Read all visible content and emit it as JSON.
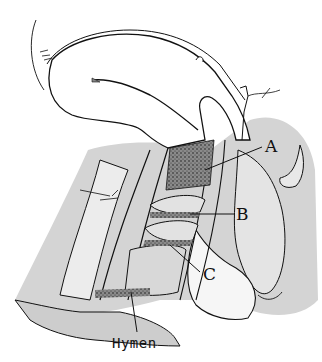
{
  "figure": {
    "type": "anatomical line drawing",
    "style": "black ink on white with gray shading and stippled regions",
    "colors": {
      "ink": "#111111",
      "shade": "#cfcfcf",
      "background": "#ffffff"
    }
  },
  "labels": {
    "a": {
      "text": "A",
      "x": 265,
      "y": 138
    },
    "b": {
      "text": "B",
      "x": 236,
      "y": 206
    },
    "c": {
      "text": "C",
      "x": 203,
      "y": 272
    },
    "hymen": {
      "text": "Hymen",
      "x": 110,
      "y": 336
    }
  }
}
